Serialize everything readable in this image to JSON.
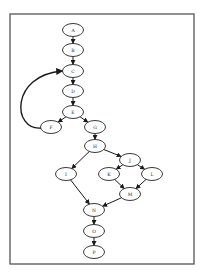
{
  "diagram": {
    "type": "directed-graph",
    "frame": {
      "x": 10,
      "y": 14,
      "width": 184,
      "height": 250,
      "stroke": "#555555"
    },
    "nodes": [
      {
        "id": "A",
        "label": "A",
        "cx": 73,
        "cy": 30
      },
      {
        "id": "B",
        "label": "B",
        "cx": 73,
        "cy": 50
      },
      {
        "id": "C",
        "label": "C",
        "cx": 73,
        "cy": 71
      },
      {
        "id": "D",
        "label": "D",
        "cx": 73,
        "cy": 91
      },
      {
        "id": "E",
        "label": "E",
        "cx": 73,
        "cy": 112
      },
      {
        "id": "F",
        "label": "F",
        "cx": 51,
        "cy": 127
      },
      {
        "id": "G",
        "label": "G",
        "cx": 95,
        "cy": 127
      },
      {
        "id": "H",
        "label": "H",
        "cx": 95,
        "cy": 146
      },
      {
        "id": "I",
        "label": "I",
        "cx": 66,
        "cy": 174
      },
      {
        "id": "J",
        "label": "J",
        "cx": 130,
        "cy": 160
      },
      {
        "id": "K",
        "label": "K",
        "cx": 109,
        "cy": 174
      },
      {
        "id": "L",
        "label": "L",
        "cx": 152,
        "cy": 174
      },
      {
        "id": "M",
        "label": "M",
        "cx": 130,
        "cy": 194
      },
      {
        "id": "N",
        "label": "N",
        "cx": 94,
        "cy": 210
      },
      {
        "id": "O",
        "label": "O",
        "cx": 94,
        "cy": 231
      },
      {
        "id": "P",
        "label": "P",
        "cx": 94,
        "cy": 252
      }
    ],
    "edges": [
      {
        "from": "A",
        "to": "B"
      },
      {
        "from": "B",
        "to": "C"
      },
      {
        "from": "C",
        "to": "D"
      },
      {
        "from": "D",
        "to": "E"
      },
      {
        "from": "E",
        "to": "F"
      },
      {
        "from": "E",
        "to": "G"
      },
      {
        "from": "F",
        "to": "C",
        "curved": true
      },
      {
        "from": "G",
        "to": "H"
      },
      {
        "from": "H",
        "to": "I"
      },
      {
        "from": "H",
        "to": "J"
      },
      {
        "from": "J",
        "to": "K"
      },
      {
        "from": "J",
        "to": "L"
      },
      {
        "from": "K",
        "to": "M"
      },
      {
        "from": "L",
        "to": "M"
      },
      {
        "from": "I",
        "to": "N"
      },
      {
        "from": "M",
        "to": "N"
      },
      {
        "from": "N",
        "to": "O"
      },
      {
        "from": "O",
        "to": "P"
      }
    ]
  }
}
